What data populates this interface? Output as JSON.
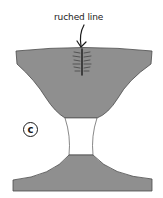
{
  "diagram": {
    "annotation": {
      "label": "ruched line",
      "arrow": "down-arrow"
    },
    "part_marker": {
      "letter": "c"
    },
    "colors": {
      "fill": "#8f8f8f",
      "outline": "#4a4a4a",
      "ruching": "#2a2a2a",
      "background": "#ffffff",
      "waist_fill": "#ffffff"
    },
    "shapes": [
      {
        "name": "upper-bowl",
        "fill": "gray"
      },
      {
        "name": "waist",
        "fill": "white"
      },
      {
        "name": "lower-base",
        "fill": "gray"
      }
    ]
  }
}
